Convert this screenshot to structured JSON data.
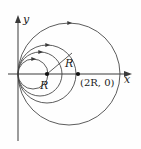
{
  "figure": {
    "axes": {
      "x_label": "x",
      "y_label": "y",
      "x_axis_y_px": 74,
      "y_axis_x_px": 18,
      "x_arrow": true,
      "y_arrow": true,
      "stroke": "#3a3a3a"
    },
    "labels": {
      "radius_at_center": "R",
      "radius_on_line": "R",
      "point_2R": "(2R, 0)",
      "axis_x": "x",
      "axis_y": "y"
    },
    "points": [
      {
        "name": "center-dot",
        "label": "",
        "cx": 47,
        "cy": 74
      },
      {
        "name": "point-2R-dot",
        "label": "(2R, 0)",
        "cx": 78,
        "cy": 74
      }
    ],
    "radius_line": {
      "x1": 47,
      "y1": 74,
      "x2": 72,
      "y2": 53,
      "label": "R"
    },
    "curve_color": "#4a4a4a",
    "curves": [
      {
        "name": "circle-1",
        "cx": 33,
        "cy": 74,
        "r": 15,
        "arrow_t": 0.0
      },
      {
        "name": "circle-2",
        "cx": 40,
        "cy": 74,
        "r": 22,
        "arrow_t": 0.0
      },
      {
        "name": "circle-3",
        "cx": 47,
        "cy": 74,
        "r": 29,
        "arrow_t": 0.0
      },
      {
        "name": "circle-4",
        "cx": 69,
        "cy": 74,
        "r": 51,
        "arrow_t": 0.0
      }
    ]
  }
}
